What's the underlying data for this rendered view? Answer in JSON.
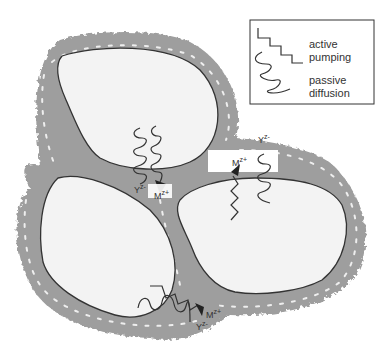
{
  "diagram": {
    "type": "cell ion transport schematic",
    "colors": {
      "background": "#ffffff",
      "cell_wall": "#9e9e9e",
      "cell_wall_dashes": "#e8e8e8",
      "cell_interior": "#f3f3f3",
      "membrane": "#333333",
      "arrows": "#333333"
    },
    "legend": {
      "items": [
        {
          "symbol": "staircase-line",
          "label_line1": "active",
          "label_line2": "pumping"
        },
        {
          "symbol": "wavy-line",
          "label_line1": "passive",
          "label_line2": "diffusion"
        }
      ]
    },
    "cells": [
      {
        "name": "top-cell"
      },
      {
        "name": "bottom-left-cell"
      },
      {
        "name": "right-cell"
      }
    ],
    "ion_labels": {
      "center_y": "Y",
      "center_y_sup": "z-",
      "center_m": "M",
      "center_m_sup": "z+",
      "right_m": "M",
      "right_m_sup": "z+",
      "right_y": "Y",
      "right_y_sup": "z-",
      "bottom_m": "M",
      "bottom_m_sup": "z+",
      "bottom_y": "Y",
      "bottom_y_sup": "z-"
    }
  }
}
